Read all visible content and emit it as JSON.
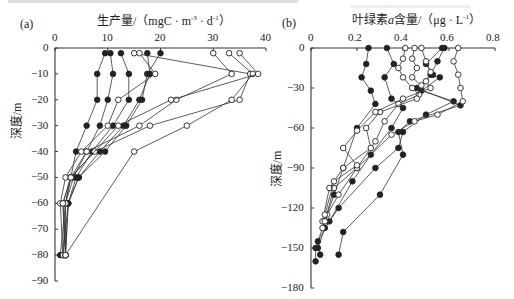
{
  "chart_data": [
    {
      "panel": "(a)",
      "type": "line",
      "title": "生产量/（mgC·m⁻³·d⁻¹）",
      "xlabel": "生产量/（mgC·m⁻³·d⁻¹）",
      "ylabel": "深度/m",
      "x_axis_position": "top",
      "xlim": [
        0,
        40
      ],
      "ylim": [
        -90,
        0
      ],
      "xticks": [
        "0",
        "10",
        "20",
        "30",
        "40"
      ],
      "yticks": [
        "0",
        "-10",
        "-20",
        "-30",
        "-40",
        "-50",
        "-60",
        "-70",
        "-80",
        "-90"
      ],
      "grid": false,
      "markers": {
        "filled": "●",
        "open": "○"
      },
      "series": [
        {
          "name": "profile-1",
          "marker": "filled",
          "points": [
            [
              9.5,
              -2
            ],
            [
              8,
              -10
            ],
            [
              8,
              -20
            ],
            [
              6,
              -30
            ],
            [
              4,
              -40
            ],
            [
              3,
              -50
            ],
            [
              2,
              -60
            ],
            [
              1,
              -80
            ]
          ]
        },
        {
          "name": "profile-2",
          "marker": "filled",
          "points": [
            [
              10.5,
              -2
            ],
            [
              11,
              -10
            ],
            [
              10,
              -20
            ],
            [
              8.5,
              -30
            ],
            [
              6,
              -40
            ],
            [
              3.5,
              -50
            ],
            [
              2,
              -60
            ],
            [
              1.5,
              -80
            ]
          ]
        },
        {
          "name": "profile-3",
          "marker": "filled",
          "points": [
            [
              12.5,
              -2
            ],
            [
              14,
              -10
            ],
            [
              14,
              -20
            ],
            [
              11,
              -30
            ],
            [
              7,
              -40
            ],
            [
              4,
              -50
            ],
            [
              2.5,
              -60
            ],
            [
              1.5,
              -80
            ]
          ]
        },
        {
          "name": "profile-4",
          "marker": "filled",
          "points": [
            [
              17.5,
              -2
            ],
            [
              18,
              -10
            ],
            [
              16,
              -20
            ],
            [
              13,
              -30
            ],
            [
              8.5,
              -40
            ],
            [
              4.5,
              -50
            ],
            [
              2.5,
              -60
            ],
            [
              2,
              -80
            ]
          ]
        },
        {
          "name": "profile-5",
          "marker": "filled",
          "points": [
            [
              20,
              -2
            ],
            [
              17.5,
              -10
            ],
            [
              16.5,
              -20
            ],
            [
              13.5,
              -30
            ],
            [
              9.5,
              -40
            ],
            [
              4.5,
              -50
            ],
            [
              2.5,
              -60
            ],
            [
              2,
              -80
            ]
          ]
        },
        {
          "name": "profile-6",
          "marker": "open",
          "points": [
            [
              15,
              -2
            ],
            [
              37,
              -10
            ],
            [
              35,
              -20
            ],
            [
              18,
              -30
            ],
            [
              7.5,
              -40
            ],
            [
              3,
              -50
            ],
            [
              2,
              -60
            ],
            [
              2,
              -80
            ]
          ]
        },
        {
          "name": "profile-7",
          "marker": "open",
          "points": [
            [
              16,
              -2
            ],
            [
              19,
              -10
            ],
            [
              12,
              -20
            ],
            [
              10,
              -30
            ],
            [
              5,
              -40
            ],
            [
              2,
              -50
            ],
            [
              1,
              -60
            ],
            [
              1.5,
              -80
            ]
          ]
        },
        {
          "name": "profile-8",
          "marker": "open",
          "points": [
            [
              30,
              -2
            ],
            [
              33.5,
              -10
            ],
            [
              23,
              -20
            ],
            [
              16,
              -30
            ],
            [
              6,
              -40
            ],
            [
              3,
              -50
            ],
            [
              1.5,
              -60
            ],
            [
              2,
              -80
            ]
          ]
        },
        {
          "name": "profile-9",
          "marker": "open",
          "points": [
            [
              33,
              -2
            ],
            [
              37.5,
              -10
            ],
            [
              33.5,
              -20
            ],
            [
              25,
              -30
            ],
            [
              15,
              -40
            ],
            [
              2,
              -80
            ]
          ]
        },
        {
          "name": "profile-10",
          "marker": "open",
          "points": [
            [
              35,
              -2
            ],
            [
              38.5,
              -10
            ],
            [
              22,
              -20
            ],
            [
              12,
              -30
            ],
            [
              3,
              -50
            ],
            [
              1.5,
              -60
            ],
            [
              2,
              -80
            ]
          ]
        }
      ]
    },
    {
      "panel": "(b)",
      "type": "line",
      "title": "叶绿素a含量/（μg·L⁻¹）",
      "xlabel": "叶绿素a含量/（μg·L⁻¹）",
      "ylabel": "深度/m",
      "x_axis_position": "top",
      "xlim": [
        0,
        0.8
      ],
      "ylim": [
        -180,
        0
      ],
      "xticks": [
        "0",
        "0.2",
        "0.4",
        "0.6",
        "0.8"
      ],
      "yticks": [
        "0",
        "-30",
        "-60",
        "-90",
        "-120",
        "-150",
        "-180"
      ],
      "grid": false,
      "markers": {
        "filled": "●",
        "open": "○"
      },
      "series": [
        {
          "name": "profile-1",
          "marker": "filled",
          "points": [
            [
              0.25,
              0
            ],
            [
              0.24,
              -12
            ],
            [
              0.22,
              -22
            ],
            [
              0.26,
              -32
            ],
            [
              0.28,
              -42
            ],
            [
              0.2,
              -60
            ],
            [
              0.14,
              -90
            ],
            [
              0.1,
              -110
            ],
            [
              0.06,
              -130
            ],
            [
              0.02,
              -150
            ],
            [
              0.02,
              -160
            ]
          ]
        },
        {
          "name": "profile-2",
          "marker": "filled",
          "points": [
            [
              0.33,
              0
            ],
            [
              0.36,
              -12
            ],
            [
              0.32,
              -22
            ],
            [
              0.35,
              -38
            ],
            [
              0.4,
              -45
            ],
            [
              0.35,
              -60
            ],
            [
              0.26,
              -80
            ],
            [
              0.18,
              -100
            ],
            [
              0.08,
              -130
            ],
            [
              0.03,
              -145
            ],
            [
              0.04,
              -155
            ]
          ]
        },
        {
          "name": "profile-3",
          "marker": "filled",
          "points": [
            [
              0.58,
              0
            ],
            [
              0.55,
              -10
            ],
            [
              0.52,
              -20
            ],
            [
              0.56,
              -22
            ],
            [
              0.48,
              -32
            ],
            [
              0.62,
              -40
            ],
            [
              0.5,
              -50
            ],
            [
              0.4,
              -63
            ],
            [
              0.38,
              -75
            ],
            [
              0.28,
              -90
            ],
            [
              0.12,
              -120
            ],
            [
              0.06,
              -135
            ],
            [
              0.03,
              -150
            ]
          ]
        },
        {
          "name": "profile-4",
          "marker": "filled",
          "points": [
            [
              0.57,
              0
            ],
            [
              0.5,
              -12
            ],
            [
              0.53,
              -20
            ],
            [
              0.46,
              -30
            ],
            [
              0.65,
              -43
            ],
            [
              0.43,
              -55
            ],
            [
              0.38,
              -63
            ],
            [
              0.4,
              -80
            ],
            [
              0.3,
              -110
            ],
            [
              0.14,
              -138
            ],
            [
              0.12,
              -155
            ]
          ]
        },
        {
          "name": "profile-5",
          "marker": "open",
          "points": [
            [
              0.41,
              0
            ],
            [
              0.4,
              -8
            ],
            [
              0.38,
              -15
            ],
            [
              0.4,
              -22
            ],
            [
              0.44,
              -30
            ],
            [
              0.47,
              -35
            ],
            [
              0.38,
              -42
            ],
            [
              0.32,
              -55
            ],
            [
              0.28,
              -70
            ],
            [
              0.2,
              -90
            ],
            [
              0.12,
              -110
            ],
            [
              0.07,
              -125
            ],
            [
              0.05,
              -135
            ]
          ]
        },
        {
          "name": "profile-6",
          "marker": "open",
          "points": [
            [
              0.45,
              0
            ],
            [
              0.44,
              -8
            ],
            [
              0.46,
              -15
            ],
            [
              0.44,
              -22
            ],
            [
              0.48,
              -28
            ],
            [
              0.46,
              -38
            ],
            [
              0.3,
              -48
            ],
            [
              0.24,
              -60
            ],
            [
              0.26,
              -75
            ],
            [
              0.14,
              -90
            ],
            [
              0.08,
              -105
            ],
            [
              0.05,
              -130
            ]
          ]
        },
        {
          "name": "profile-7",
          "marker": "open",
          "points": [
            [
              0.64,
              0
            ],
            [
              0.62,
              -10
            ],
            [
              0.64,
              -20
            ],
            [
              0.65,
              -30
            ],
            [
              0.66,
              -40
            ],
            [
              0.55,
              -50
            ],
            [
              0.45,
              -55
            ],
            [
              0.35,
              -65
            ],
            [
              0.2,
              -90
            ],
            [
              0.1,
              -105
            ],
            [
              0.06,
              -130
            ]
          ]
        },
        {
          "name": "profile-8",
          "marker": "open",
          "points": [
            [
              0.48,
              0
            ],
            [
              0.5,
              -10
            ],
            [
              0.52,
              -18
            ],
            [
              0.5,
              -25
            ],
            [
              0.52,
              -30
            ],
            [
              0.4,
              -38
            ],
            [
              0.28,
              -48
            ],
            [
              0.2,
              -62
            ],
            [
              0.14,
              -75
            ],
            [
              0.2,
              -88
            ],
            [
              0.1,
              -100
            ],
            [
              0.06,
              -125
            ]
          ]
        }
      ]
    }
  ],
  "panels": {
    "a": {
      "label": "(a)",
      "xtitle": "生产量/（mgC · m",
      "xtitle_sup1": "-3",
      "xtitle_mid": " · d",
      "xtitle_sup2": "-1",
      "xtitle_end": "）",
      "ylabel": "深度/m",
      "xticks": [
        "0",
        "10",
        "20",
        "30",
        "40"
      ],
      "yticks": [
        "0",
        "−10",
        "−20",
        "−30",
        "−40",
        "−50",
        "−60",
        "−70",
        "−80",
        "−90"
      ]
    },
    "b": {
      "label": "(b)",
      "xtitle_pre": "叶绿素",
      "xtitle_italic": "a",
      "xtitle_post": "含量/（μg · L",
      "xtitle_sup": "-1",
      "xtitle_end": "）",
      "ylabel": "深度/m",
      "xticks": [
        "0",
        "0.2",
        "0.4",
        "0.6",
        "0.8"
      ],
      "yticks": [
        "0",
        "−30",
        "−60",
        "−90",
        "−120",
        "−150",
        "−180"
      ]
    }
  }
}
